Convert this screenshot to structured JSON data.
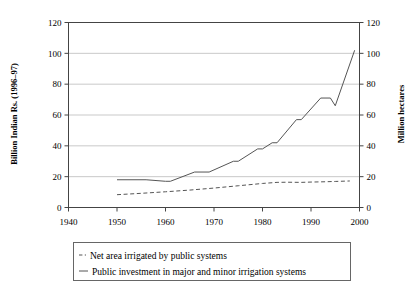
{
  "chart_data": {
    "type": "line",
    "title": "",
    "xlabel": "",
    "ylabel": "Billion Indian Rs. (1996–97)",
    "y2label": "Million hectares",
    "xlim": [
      1940,
      2000
    ],
    "ylim": [
      0,
      120
    ],
    "y2lim": [
      0,
      120
    ],
    "xticks": [
      1940,
      1950,
      1960,
      1970,
      1980,
      1990,
      2000
    ],
    "yticks": [
      0,
      20,
      40,
      60,
      80,
      100,
      120
    ],
    "y2ticks": [
      0,
      20,
      40,
      60,
      80,
      100,
      120
    ],
    "grid": "horizontal",
    "legend_position": "below",
    "series": [
      {
        "name": "Net area irrigated by public systems",
        "style": "dashed",
        "axis": "right",
        "x": [
          1950,
          1955,
          1960,
          1965,
          1970,
          1975,
          1980,
          1983,
          1985,
          1988,
          1990,
          1993,
          1995,
          1998
        ],
        "values": [
          8.3,
          9.2,
          10.2,
          11.3,
          12.6,
          14.1,
          15.6,
          16.3,
          16.4,
          16.3,
          16.5,
          16.7,
          16.9,
          17.2
        ]
      },
      {
        "name": "Public investment in major and minor irrigation systems",
        "style": "solid",
        "axis": "left",
        "x": [
          1950,
          1956,
          1960,
          1961,
          1966,
          1969,
          1974,
          1975,
          1979,
          1980,
          1982,
          1983,
          1987,
          1988,
          1992,
          1994,
          1995,
          1999
        ],
        "values": [
          18,
          18,
          17,
          17,
          23,
          23,
          30,
          30,
          38,
          38,
          42,
          42,
          57,
          57,
          71,
          71,
          66,
          102
        ]
      }
    ],
    "legend": [
      {
        "label": "Net area irrigated by public systems",
        "style": "dashed"
      },
      {
        "label": "Public investment in major and minor irrigation systems",
        "style": "solid"
      }
    ]
  }
}
